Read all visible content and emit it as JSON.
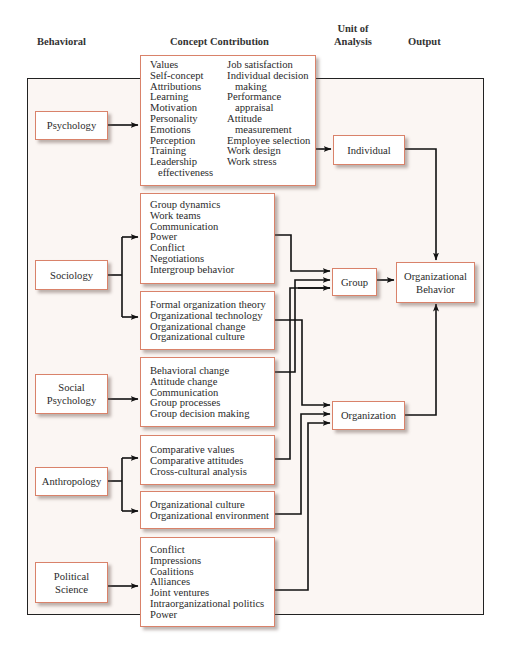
{
  "headers": {
    "behavioral": "Behavioral",
    "concept_contribution": "Concept Contribution",
    "unit_of_analysis_line1": "Unit of",
    "unit_of_analysis_line2": "Analysis",
    "output": "Output"
  },
  "disciplines": {
    "psychology": "Psychology",
    "sociology": "Sociology",
    "social_psychology_line1": "Social",
    "social_psychology_line2": "Psychology",
    "anthropology": "Anthropology",
    "political_science_line1": "Political",
    "political_science_line2": "Science"
  },
  "concepts": {
    "psychology_col1": [
      "Values",
      "Self-concept",
      "Attributions",
      "Learning",
      "Motivation",
      "Personality",
      "Emotions",
      "Perception",
      "Training",
      "Leadership",
      "effectiveness"
    ],
    "psychology_col2": [
      "Job satisfaction",
      "Individual decision",
      "making",
      "Performance",
      "appraisal",
      "Attitude",
      "measurement",
      "Employee selection",
      "Work design",
      "Work stress"
    ],
    "sociology_group": [
      "Group dynamics",
      "Work teams",
      "Communication",
      "Power",
      "Conflict",
      "Negotiations",
      "Intergroup behavior"
    ],
    "sociology_org": [
      "Formal organization theory",
      "Organizational technology",
      "Organizational change",
      "Organizational culture"
    ],
    "social_psychology": [
      "Behavioral change",
      "Attitude change",
      "Communication",
      "Group processes",
      "Group decision making"
    ],
    "anthropology_group": [
      "Comparative values",
      "Comparative attitudes",
      "Cross-cultural analysis"
    ],
    "anthropology_org": [
      "Organizational culture",
      "Organizational environment"
    ],
    "political_science": [
      "Conflict",
      "Impressions",
      "Coalitions",
      "Alliances",
      "Joint ventures",
      "Intraorganizational politics",
      "Power"
    ]
  },
  "units": {
    "individual": "Individual",
    "group": "Group",
    "organization": "Organization"
  },
  "output": {
    "line1": "Organizational",
    "line2": "Behavior"
  },
  "colors": {
    "box_border": "#d9826a",
    "frame_bg": "#fbf6f3",
    "line": "#111111"
  }
}
